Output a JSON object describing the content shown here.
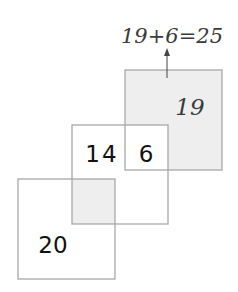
{
  "equation": "19+6=25",
  "squares": {
    "top_right": {
      "label": "19"
    },
    "middle": {
      "label_left": "14",
      "label_overlap": "6"
    },
    "bottom_left": {
      "label": "20"
    }
  },
  "colors": {
    "border": "#a8a8a8",
    "shade": "#eeeeee",
    "text": "#111111",
    "handwriting": "#3a3a3a"
  }
}
